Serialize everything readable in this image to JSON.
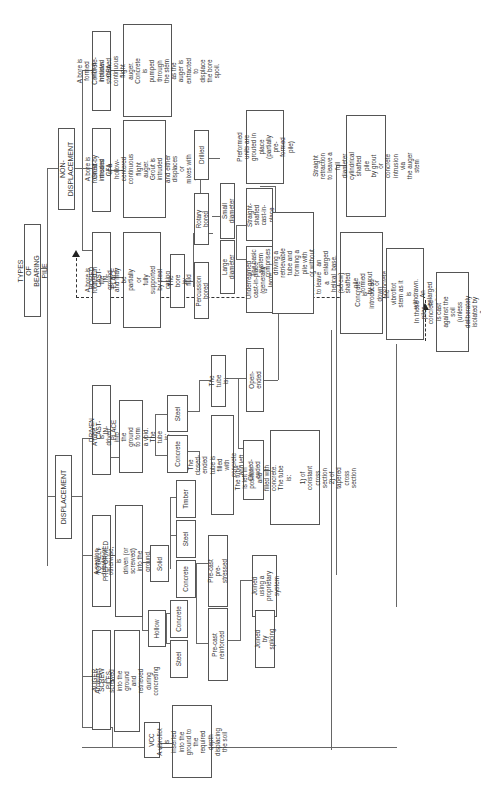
{
  "diagram": {
    "title": "TYPES OF BEARING PILE",
    "orientation": "rotated 90° counter-clockwise",
    "root": "TYPES OF BEARING PILE",
    "branches": {
      "displacement": {
        "label": "DISPLACEMENT",
        "auger_screw": {
          "label": "AUGER SCREW PILES",
          "desc": "An auger is screwed into the\nground and retrieved during\nconcreting"
        },
        "totally_preformed": {
          "label": "TOTALLY PREFORMED",
          "desc": "A section, tubular or otherwise, is\ndriven (or screwed) into the ground.\nThe section is:",
          "hollow": "Hollow",
          "hollow_steel": "Steel",
          "hollow_concrete": "Concrete",
          "solid": "Solid",
          "solid_concrete": "Concrete",
          "solid_steel": "Steel",
          "solid_timber": "Timber",
          "precast_reinforced": "Pre-cast reinforced",
          "precast_prestressed": "Pre-cast pre-stressed",
          "joined_splicing": "Joined by splicing",
          "joined_proprietary": "Joined using a\nproprietary system"
        },
        "driven_cast": {
          "label": "DRIVEN CAST-IN-PLACE",
          "desc": "A tube is driven into the\nground to form a void.\nThe tube is:",
          "concrete": "Concrete",
          "steel": "Steel",
          "concrete_desc": "The closed-ended tube is filled\nwith concrete and left in position",
          "tube_is": "The tube is:",
          "closed_ended": "Closed-ended",
          "open_ended": "Open-ended",
          "closed_desc": "The tube is left in position and\nfilled with concrete. The tube is:\n\n1) of constant cross section\n2) of tapered cross section",
          "open_desc": "The basic system comprises\ndriving a retrievable tube and\nforming a pile with or without\nan enlarged base."
        },
        "vcc": {
          "label": "VCC",
          "desc": "A vibroflot is inserted\ninto the ground to the\nrequired depth\ndisplacing the soil",
          "concrete_desc": "Concrete is introduced down\nthe vibroflot stem as it is\nwithdrawn. An enlarged base\ncan be formed"
        }
      },
      "non_displacement": {
        "label": "NON-DISPLACEMENT",
        "bored_cast": {
          "label": "BORED CAST-IN-PLACE",
          "desc": "A bore is formed in the\nground and may be partially or\nfully supported by steel casing\nor support fluid (mud)",
          "bore_is": "The bore is:",
          "percussion": "Percussion bored",
          "rotary": "Rotary bored",
          "drilled": "Drilled",
          "large_diameter": "Large diameter",
          "small_diameter": "Small diameter",
          "underreamed": "Underreamed\ncast-in-place\n(generally large\ndiameter)",
          "straight_shafted": "Straight-shafted\ncast-in-place",
          "preformed_grouted": "Preformed units are\ngrouted in place\n(partially pre-formed pile)"
        },
        "grout_cfa": {
          "label": "Grout-intruded\nCFA",
          "desc": "A bore is formed by means\nof a hollow-centered continuous\nflight auger. Grout is intruded\nand either displaces or\nmixes with the bore spoil."
        },
        "concrete_cfa": {
          "label": "Concrete-intruded\nCFA",
          "desc": "A bore is formed with a\nhollow-stemmed continuous\nflight auger. Concrete is\npumped through the stem\nas the auger is extracted to\ndisplace the bore spoil."
        },
        "back_screwing": "By back-screwing to leave a\nhelical (screw) shafted pile formed\nby grout or concrete intrusion via\nthe auger stem",
        "straight_retraction": "Straight retraction to leave a full\ndiameter cylindrical shafted pile\nby grout or concrete intrusion via\nthe auger stem"
      }
    },
    "note": "In these piles, concrete\nis cast against the soil\n(unless deliberately\nisolated by a membrane)"
  },
  "colors": {
    "line": "#666666",
    "border": "#555555",
    "text": "#333333",
    "background": "#ffffff"
  }
}
